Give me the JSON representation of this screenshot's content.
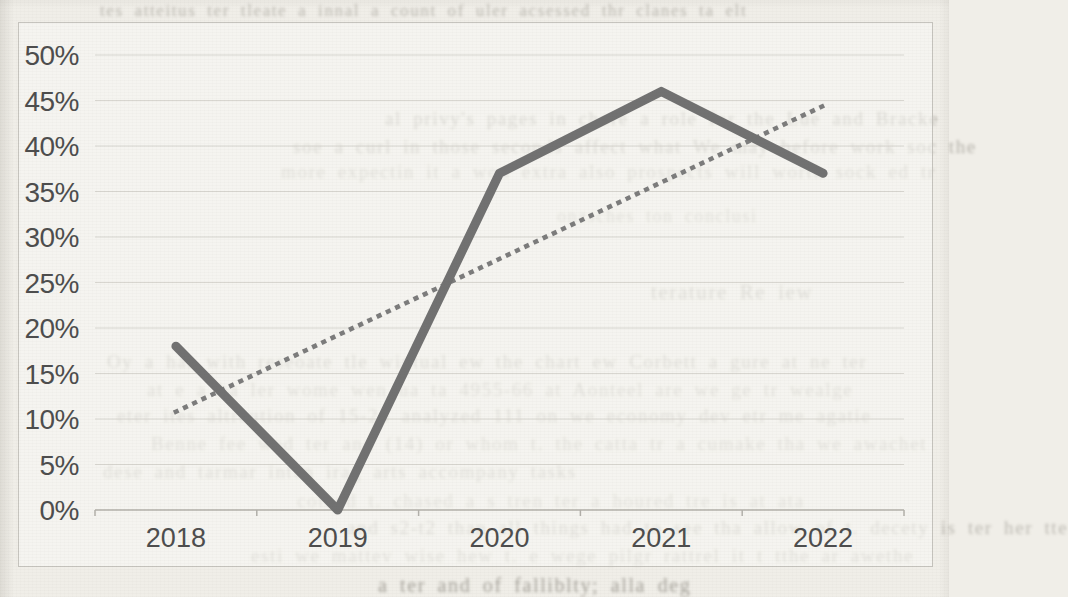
{
  "page": {
    "kind": "scanned book/paper page with embedded chart",
    "background_color": "#f0eee8"
  },
  "theme": {
    "chart_background": "#faf9f5",
    "frame_border_color": "#c6c4be",
    "gridline_color": "#d8d6d0",
    "axis_color": "#b2b0aa",
    "tick_label_color": "#4d4d4d"
  },
  "chart_data": {
    "type": "line",
    "title": "",
    "xlabel": "",
    "ylabel": "",
    "categories": [
      "2018",
      "2019",
      "2020",
      "2021",
      "2022"
    ],
    "series": [
      {
        "name": "main-series",
        "style": "solid",
        "color": "#717171",
        "stroke_width": 9,
        "values": [
          18,
          0,
          37,
          46,
          37
        ]
      },
      {
        "name": "linear-trendline",
        "style": "dotted",
        "color": "#7c7c7c",
        "stroke_width": 4.6,
        "values": [
          10.8,
          19.2,
          27.6,
          36.0,
          44.4
        ]
      }
    ],
    "ylim": [
      0,
      50
    ],
    "ytick_step": 5,
    "ytick_format": "percent",
    "ytick_labels": [
      "0%",
      "5%",
      "10%",
      "15%",
      "20%",
      "25%",
      "30%",
      "35%",
      "40%",
      "45%",
      "50%"
    ],
    "grid": true,
    "legend": "none"
  },
  "bleed_text_fragments": [
    {
      "text": "tes atteitus ter tleate a innal a count of uler acsessed thr clanes ta elt",
      "x": 100,
      "y": 1,
      "size": 17,
      "opacity": 0.42
    },
    {
      "text": "al privy's pages in chore a role for the Lue and Bracke",
      "x": 385,
      "y": 108,
      "size": 19,
      "opacity": 0.46
    },
    {
      "text": "soe a curl in those seconds affect what We may before work soc the",
      "x": 293,
      "y": 136,
      "size": 19,
      "opacity": 0.46
    },
    {
      "text": "more expectin it a won extra also prospects will worth sock ed tr",
      "x": 281,
      "y": 161,
      "size": 19,
      "opacity": 0.36
    },
    {
      "text": "onzsches ton conclusi",
      "x": 557,
      "y": 206,
      "size": 18,
      "opacity": 0.32
    },
    {
      "text": "terature Re iew",
      "x": 651,
      "y": 280,
      "size": 21,
      "opacity": 0.4
    },
    {
      "text": "Oy a har with reseoate tle wintual ew the chart ew Corbett a gure at ne ter",
      "x": 107,
      "y": 351,
      "size": 19,
      "opacity": 0.4
    },
    {
      "text": "at e a ha ler wome wen ua ta 4955-66 at Aonteel are we ge tr wealge",
      "x": 147,
      "y": 379,
      "size": 19,
      "opacity": 0.35
    },
    {
      "text": "eter ites altreution of 15-24 analyzed 111 on we economy dev etr me agatie",
      "x": 117,
      "y": 405,
      "size": 19,
      "opacity": 0.38
    },
    {
      "text": "Benne fee wed ter and (14) or whom t. the catta tr a cumake tha we awachet",
      "x": 151,
      "y": 433,
      "size": 19,
      "opacity": 0.35
    },
    {
      "text": "dese and tarmar intan irag arts accompany tasks",
      "x": 103,
      "y": 461,
      "size": 19,
      "opacity": 0.37
    },
    {
      "text": "cothed t. chased a s tren ter a houred tre is at ata",
      "x": 297,
      "y": 490,
      "size": 19,
      "opacity": 0.32
    },
    {
      "text": "and s2-t2 than all things had to see tha allow of t. decety is ter her tte",
      "x": 347,
      "y": 517,
      "size": 19,
      "opacity": 0.4
    },
    {
      "text": "esti we mattev wise hew t. e wege pilgr rattrel it t tthe ar awethe",
      "x": 251,
      "y": 545,
      "size": 19,
      "opacity": 0.35
    },
    {
      "text": "a ter and of falliblty; alla deg",
      "x": 378,
      "y": 574,
      "size": 20,
      "opacity": 0.58
    }
  ]
}
